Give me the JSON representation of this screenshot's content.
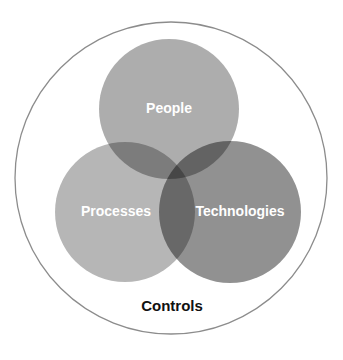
{
  "diagram": {
    "type": "venn",
    "container": {
      "label": "Controls",
      "stroke": "#8c8c8c",
      "cx": 171,
      "cy": 178,
      "r": 157
    },
    "circles": [
      {
        "id": "people",
        "label": "People",
        "color": "#a6a6a6",
        "cx": 169,
        "cy": 109,
        "r": 70
      },
      {
        "id": "processes",
        "label": "Processes",
        "color": "#acacac",
        "cx": 125,
        "cy": 212,
        "r": 70
      },
      {
        "id": "technologies",
        "label": "Technologies",
        "color": "#888888",
        "cx": 230,
        "cy": 212,
        "r": 71
      }
    ]
  }
}
